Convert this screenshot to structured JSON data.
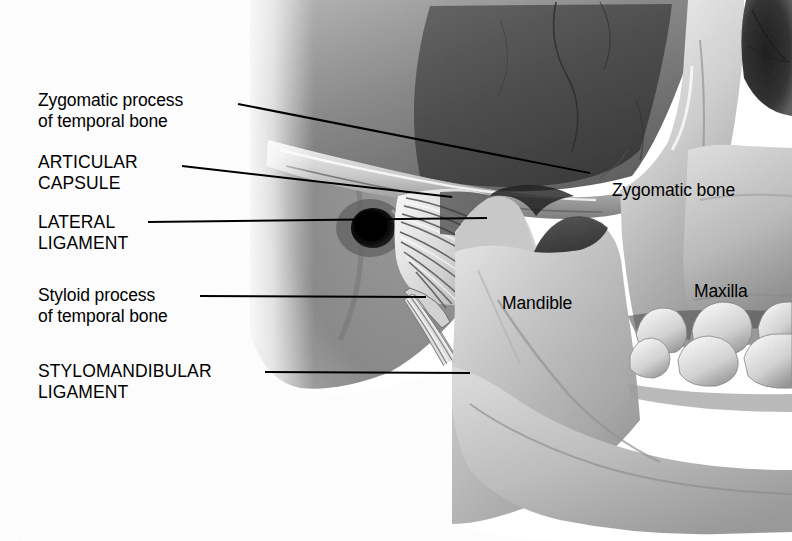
{
  "figure": {
    "background_color": "#ffffff",
    "text_color": "#000000",
    "leader_color": "#000000",
    "width": 792,
    "height": 541
  },
  "palette": {
    "bone_light": "#e9e9e9",
    "bone_mid": "#cfcfcf",
    "bone_shadow": "#a8a8a8",
    "fossa_dark": "#8a8a8a",
    "orbit_dark": "#6f6f6f",
    "ear_canal_black": "#1a1a1a",
    "ligament_pale": "#f2f2f2",
    "soft_tissue": "#bdbdbd"
  },
  "labels": {
    "left": [
      {
        "id": "zygomatic-process",
        "lines": [
          "Zygomatic process",
          "of temporal bone"
        ],
        "style": "sentence",
        "x": 38,
        "y": 90
      },
      {
        "id": "articular-capsule",
        "lines": [
          "ARTICULAR",
          "CAPSULE"
        ],
        "style": "caps",
        "x": 38,
        "y": 152
      },
      {
        "id": "lateral-ligament",
        "lines": [
          "LATERAL",
          "LIGAMENT"
        ],
        "style": "caps",
        "x": 38,
        "y": 212
      },
      {
        "id": "styloid-process",
        "lines": [
          "Styloid process",
          "of temporal bone"
        ],
        "style": "sentence",
        "x": 38,
        "y": 285
      },
      {
        "id": "stylomandibular-ligament",
        "lines": [
          "STYLOMANDIBULAR",
          "LIGAMENT"
        ],
        "style": "caps",
        "x": 38,
        "y": 361
      }
    ],
    "right": [
      {
        "id": "zygomatic-bone",
        "text": "Zygomatic bone",
        "x": 612,
        "y": 180
      },
      {
        "id": "mandible",
        "text": "Mandible",
        "x": 502,
        "y": 293
      },
      {
        "id": "maxilla",
        "text": "Maxilla",
        "x": 694,
        "y": 281
      }
    ]
  },
  "leaders": [
    {
      "id": "leader-zygomatic-process",
      "x1": 238,
      "y1": 103,
      "x2": 590,
      "y2": 173
    },
    {
      "id": "leader-articular-capsule",
      "x1": 182,
      "y1": 165,
      "x2": 452,
      "y2": 196
    },
    {
      "id": "leader-lateral-ligament",
      "x1": 148,
      "y1": 221,
      "x2": 487,
      "y2": 217
    },
    {
      "id": "leader-styloid-process",
      "x1": 200,
      "y1": 295,
      "x2": 426,
      "y2": 296
    },
    {
      "id": "leader-stylomandibular-ligament",
      "x1": 265,
      "y1": 371,
      "x2": 470,
      "y2": 372
    }
  ],
  "anatomy": {
    "structures": [
      "temporal-squama",
      "zygomatic-arch",
      "external-acoustic-meatus",
      "articular-capsule-fibers",
      "lateral-ligament-fibers",
      "styloid-process",
      "stylomandibular-ligament-band",
      "mandibular-ramus",
      "coronoid-process",
      "mandibular-notch",
      "mandible-body",
      "zygomatic-bone",
      "maxilla",
      "orbital-margin",
      "upper-molars",
      "lower-molars",
      "soft-tissue-fade"
    ],
    "teeth": {
      "upper_molars": 3,
      "lower_molars": 3
    }
  }
}
